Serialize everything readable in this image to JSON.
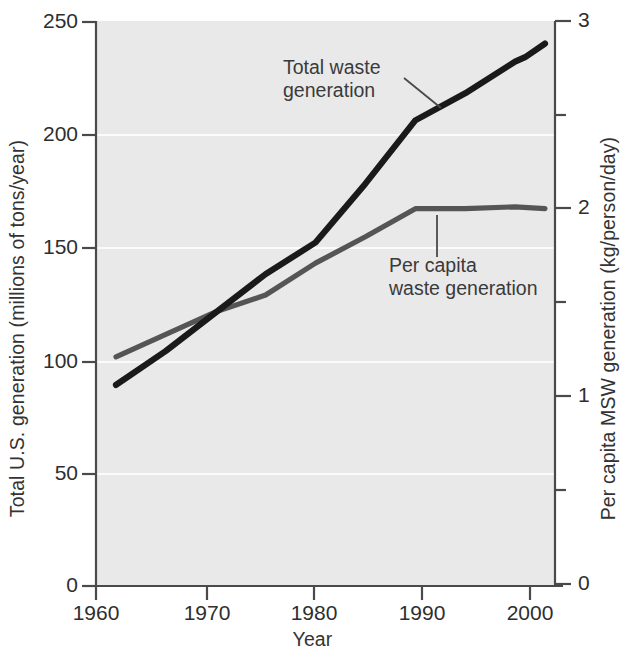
{
  "chart_data": {
    "type": "line",
    "title": "",
    "subtitle": "",
    "xlabel": "Year",
    "ylabel": "Total U.S. generation (millions of tons/year)",
    "ylabel_right": "Per capita MSW generation (kg/person/day)",
    "xlim": [
      1958,
      2004
    ],
    "ylim": [
      0,
      250
    ],
    "ylim_right": [
      0,
      3
    ],
    "xticks": [
      1960,
      1970,
      1980,
      1990,
      2000
    ],
    "xtick_labels": [
      "1960",
      "1970",
      "1980",
      "1990",
      "2000"
    ],
    "yticks": [
      0,
      50,
      100,
      150,
      200,
      250
    ],
    "ytick_labels": [
      "0",
      "50",
      "100",
      "150",
      "200",
      "250"
    ],
    "yticks_right": [
      0,
      0.5,
      1,
      1.5,
      2,
      2.5,
      3
    ],
    "ytick_labels_right": [
      "0",
      "",
      "1",
      "",
      "2",
      "",
      "3"
    ],
    "grid": "horizontal-faint-white",
    "legend": "inline-annotations",
    "plot_bgcolor": "#e9e9e9",
    "series": [
      {
        "name": "Total waste generation",
        "axis": "left",
        "color": "#1a1a1a",
        "unit": "millions of tons/year",
        "x": [
          1960,
          1965,
          1970,
          1975,
          1980,
          1985,
          1990,
          1995,
          2000,
          2001,
          2003
        ],
        "values": [
          89,
          104,
          121,
          138,
          152,
          178,
          206,
          218,
          232,
          234,
          240
        ]
      },
      {
        "name": "Per capita waste generation",
        "axis": "right",
        "color": "#555555",
        "unit": "kg/person/day",
        "x": [
          1960,
          1965,
          1970,
          1975,
          1980,
          1985,
          1990,
          1995,
          2000,
          2003
        ],
        "values": [
          1.21,
          1.33,
          1.45,
          1.54,
          1.71,
          1.85,
          2.0,
          2.0,
          2.01,
          2.0
        ]
      }
    ],
    "annotations": [
      {
        "id": "total-waste",
        "text_lines": [
          "Total waste",
          "generation"
        ],
        "points_to_series": "Total waste generation",
        "points_to_x": 1989
      },
      {
        "id": "per-capita",
        "text_lines": [
          "Per capita",
          "waste generation"
        ],
        "points_to_series": "Per capita waste generation",
        "points_to_x": 1991
      }
    ]
  },
  "annotations": {
    "total_line1": "Total waste",
    "total_line2": "generation",
    "percapita_line1": "Per capita",
    "percapita_line2": "waste generation"
  },
  "axes": {
    "x_title": "Year",
    "y_left_title": "Total U.S. generation (millions of tons/year)",
    "y_right_title": "Per capita MSW generation (kg/person/day)",
    "x_ticks": [
      "1960",
      "1970",
      "1980",
      "1990",
      "2000"
    ],
    "y_left_ticks": [
      "250",
      "200",
      "150",
      "100",
      "50",
      "0"
    ],
    "y_right_ticks": [
      "3",
      "2",
      "1",
      "0"
    ]
  }
}
